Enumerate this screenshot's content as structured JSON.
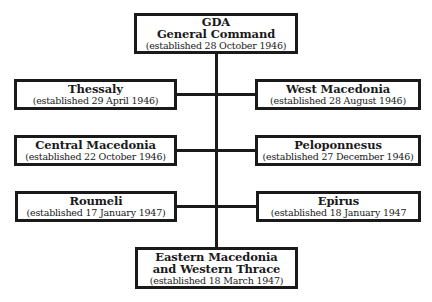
{
  "diagram": {
    "type": "organizational-chart",
    "root": {
      "title_lines": [
        "GDA",
        "General Command"
      ],
      "established": "(established 28 October 1946)"
    },
    "left_branches": [
      {
        "title": "Thessaly",
        "established": "(established 29 April 1946)"
      },
      {
        "title": "Central Macedonia",
        "established": "(established 22 October 1946)"
      },
      {
        "title": "Roumeli",
        "established": "(established 17 January 1947)"
      }
    ],
    "right_branches": [
      {
        "title": "West Macedonia",
        "established": "(established 28 August 1946)"
      },
      {
        "title": "Peloponnesus",
        "established": "(established 27 December 1946)"
      },
      {
        "title": "Epirus",
        "established": "(established 18 January 1947"
      }
    ],
    "bottom": {
      "title_lines": [
        "Eastern Macedonia",
        "and Western Thrace"
      ],
      "established": "(established 18 March 1947)"
    },
    "colors": {
      "line": "#1a1a1a",
      "box_fill": "#ffffff",
      "background": "#ffffff"
    }
  }
}
